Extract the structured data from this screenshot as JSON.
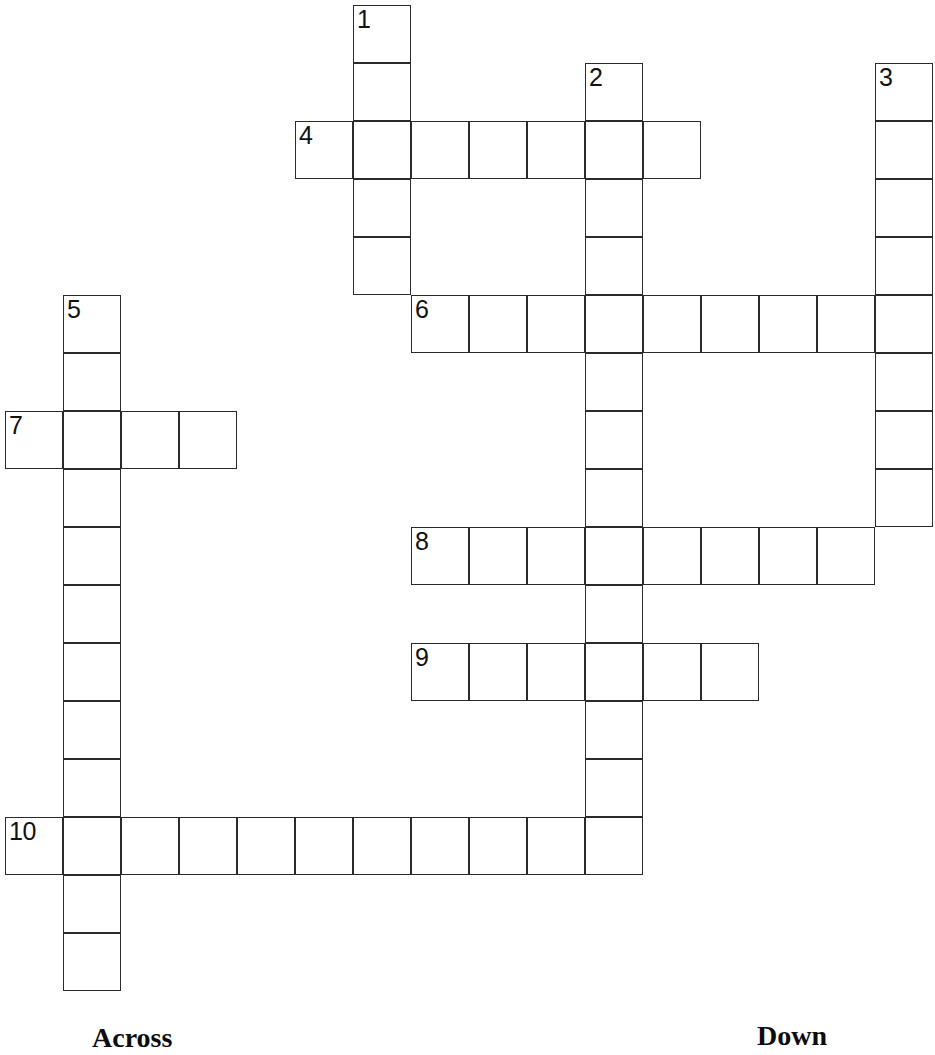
{
  "puzzle": {
    "kind": "crossword-grid",
    "width": 935,
    "height": 1055,
    "cell_size": 58,
    "origin_x": 5,
    "origin_y": 5,
    "line_color": "#2b2b2b",
    "cell_fill": "#ffffff",
    "background": "#ffffff",
    "number_color": "#111111"
  },
  "labels": {
    "across": "Across",
    "down": "Down"
  },
  "entries": [
    {
      "number": "1",
      "direction": "down",
      "col": 6,
      "row": 0,
      "length": 5
    },
    {
      "number": "2",
      "direction": "down",
      "col": 10,
      "row": 1,
      "length": 13
    },
    {
      "number": "3",
      "direction": "down",
      "col": 15,
      "row": 1,
      "length": 9
    },
    {
      "number": "4",
      "direction": "across",
      "col": 5,
      "row": 2,
      "length": 7
    },
    {
      "number": "5",
      "direction": "down",
      "col": 1,
      "row": 5,
      "length": 12
    },
    {
      "number": "6",
      "direction": "across",
      "col": 7,
      "row": 5,
      "length": 9
    },
    {
      "number": "7",
      "direction": "across",
      "col": 0,
      "row": 7,
      "length": 4
    },
    {
      "number": "8",
      "direction": "across",
      "col": 7,
      "row": 9,
      "length": 8
    },
    {
      "number": "9",
      "direction": "across",
      "col": 7,
      "row": 11,
      "length": 6
    },
    {
      "number": "10",
      "direction": "across",
      "col": 0,
      "row": 14,
      "length": 11
    }
  ],
  "numbered_cells": [
    {
      "number": "1",
      "col": 6,
      "row": 0
    },
    {
      "number": "2",
      "col": 10,
      "row": 1
    },
    {
      "number": "3",
      "col": 15,
      "row": 1
    },
    {
      "number": "4",
      "col": 5,
      "row": 2
    },
    {
      "number": "5",
      "col": 1,
      "row": 5
    },
    {
      "number": "6",
      "col": 7,
      "row": 5
    },
    {
      "number": "7",
      "col": 0,
      "row": 7
    },
    {
      "number": "8",
      "col": 7,
      "row": 9
    },
    {
      "number": "9",
      "col": 7,
      "row": 11
    },
    {
      "number": "10",
      "col": 0,
      "row": 14
    }
  ],
  "cells": [
    {
      "col": 6,
      "row": 0
    },
    {
      "col": 6,
      "row": 1
    },
    {
      "col": 10,
      "row": 1
    },
    {
      "col": 15,
      "row": 1
    },
    {
      "col": 5,
      "row": 2
    },
    {
      "col": 6,
      "row": 2
    },
    {
      "col": 7,
      "row": 2
    },
    {
      "col": 8,
      "row": 2
    },
    {
      "col": 9,
      "row": 2
    },
    {
      "col": 10,
      "row": 2
    },
    {
      "col": 11,
      "row": 2
    },
    {
      "col": 15,
      "row": 2
    },
    {
      "col": 6,
      "row": 3
    },
    {
      "col": 10,
      "row": 3
    },
    {
      "col": 15,
      "row": 3
    },
    {
      "col": 6,
      "row": 4
    },
    {
      "col": 10,
      "row": 4
    },
    {
      "col": 15,
      "row": 4
    },
    {
      "col": 1,
      "row": 5
    },
    {
      "col": 7,
      "row": 5
    },
    {
      "col": 8,
      "row": 5
    },
    {
      "col": 9,
      "row": 5
    },
    {
      "col": 10,
      "row": 5
    },
    {
      "col": 11,
      "row": 5
    },
    {
      "col": 12,
      "row": 5
    },
    {
      "col": 13,
      "row": 5
    },
    {
      "col": 14,
      "row": 5
    },
    {
      "col": 15,
      "row": 5
    },
    {
      "col": 1,
      "row": 6
    },
    {
      "col": 10,
      "row": 6
    },
    {
      "col": 15,
      "row": 6
    },
    {
      "col": 0,
      "row": 7
    },
    {
      "col": 1,
      "row": 7
    },
    {
      "col": 2,
      "row": 7
    },
    {
      "col": 3,
      "row": 7
    },
    {
      "col": 10,
      "row": 7
    },
    {
      "col": 15,
      "row": 7
    },
    {
      "col": 1,
      "row": 8
    },
    {
      "col": 10,
      "row": 8
    },
    {
      "col": 15,
      "row": 8
    },
    {
      "col": 1,
      "row": 9
    },
    {
      "col": 7,
      "row": 9
    },
    {
      "col": 8,
      "row": 9
    },
    {
      "col": 9,
      "row": 9
    },
    {
      "col": 10,
      "row": 9
    },
    {
      "col": 11,
      "row": 9
    },
    {
      "col": 12,
      "row": 9
    },
    {
      "col": 13,
      "row": 9
    },
    {
      "col": 14,
      "row": 9
    },
    {
      "col": 1,
      "row": 10
    },
    {
      "col": 10,
      "row": 10
    },
    {
      "col": 1,
      "row": 11
    },
    {
      "col": 7,
      "row": 11
    },
    {
      "col": 8,
      "row": 11
    },
    {
      "col": 9,
      "row": 11
    },
    {
      "col": 10,
      "row": 11
    },
    {
      "col": 11,
      "row": 11
    },
    {
      "col": 12,
      "row": 11
    },
    {
      "col": 1,
      "row": 12
    },
    {
      "col": 10,
      "row": 12
    },
    {
      "col": 1,
      "row": 13
    },
    {
      "col": 10,
      "row": 13
    },
    {
      "col": 0,
      "row": 14
    },
    {
      "col": 1,
      "row": 14
    },
    {
      "col": 2,
      "row": 14
    },
    {
      "col": 3,
      "row": 14
    },
    {
      "col": 4,
      "row": 14
    },
    {
      "col": 5,
      "row": 14
    },
    {
      "col": 6,
      "row": 14
    },
    {
      "col": 7,
      "row": 14
    },
    {
      "col": 8,
      "row": 14
    },
    {
      "col": 9,
      "row": 14
    },
    {
      "col": 10,
      "row": 14
    },
    {
      "col": 1,
      "row": 15
    },
    {
      "col": 1,
      "row": 16
    }
  ]
}
